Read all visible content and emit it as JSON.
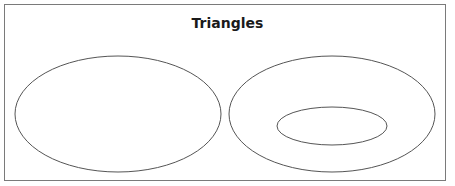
{
  "diagram": {
    "title": "Triangles",
    "shapes": [
      {
        "id": "left-set",
        "type": "ellipse",
        "cx": 118,
        "cy": 114,
        "rx": 103,
        "ry": 58
      },
      {
        "id": "right-outer-set",
        "type": "ellipse",
        "cx": 332,
        "cy": 114,
        "rx": 103,
        "ry": 58
      },
      {
        "id": "right-inner-subset",
        "type": "ellipse",
        "cx": 332,
        "cy": 126,
        "rx": 55,
        "ry": 19
      }
    ],
    "stroke_color": "#555555"
  }
}
